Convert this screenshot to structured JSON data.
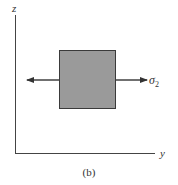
{
  "diagram": {
    "axes": {
      "vertical_label": "z",
      "horizontal_label": "y"
    },
    "element": {
      "shape": "square",
      "fill_color": "#9a9a9a",
      "border_color": "#3a3a3a"
    },
    "stress": {
      "symbol": "σ",
      "subscript": "2",
      "direction": "horizontal tension (both sides)"
    },
    "caption": "(b)"
  }
}
